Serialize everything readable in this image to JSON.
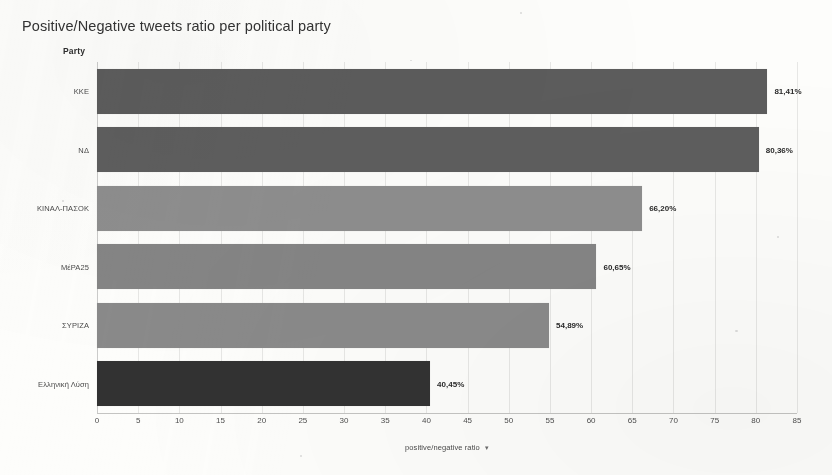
{
  "chart_data": {
    "type": "bar",
    "orientation": "horizontal",
    "title": "Positive/Negative tweets ratio per political party",
    "xlabel": "positive/negative ratio",
    "ylabel": "Party",
    "xlim": [
      0,
      85
    ],
    "grid": true,
    "legend": false,
    "categories": [
      "ΚΚΕ",
      "ΝΔ",
      "ΚΙΝΑΛ-ΠΑΣΟΚ",
      "ΜέΡΑ25",
      "ΣΥΡΙΖΑ",
      "Ελληνική Λύση"
    ],
    "values": [
      81.41,
      80.36,
      66.2,
      60.65,
      54.89,
      40.45
    ],
    "value_labels": [
      "81,41%",
      "80,36%",
      "66,20%",
      "60,65%",
      "54,89%",
      "40,45%"
    ],
    "bar_colors": [
      "#5c5c5c",
      "#5e5e5e",
      "#8e8e8e",
      "#858585",
      "#8a8a8a",
      "#323232"
    ],
    "xticks": [
      0,
      5,
      10,
      15,
      20,
      25,
      30,
      35,
      40,
      45,
      50,
      55,
      60,
      65,
      70,
      75,
      80,
      85
    ],
    "xtick_labels": [
      "0",
      "5",
      "10",
      "15",
      "20",
      "25",
      "30",
      "35",
      "40",
      "45",
      "50",
      "55",
      "60",
      "65",
      "70",
      "75",
      "80",
      "85"
    ],
    "axis_sort_marker": "▾",
    "background_color": "#fdfdfb"
  }
}
